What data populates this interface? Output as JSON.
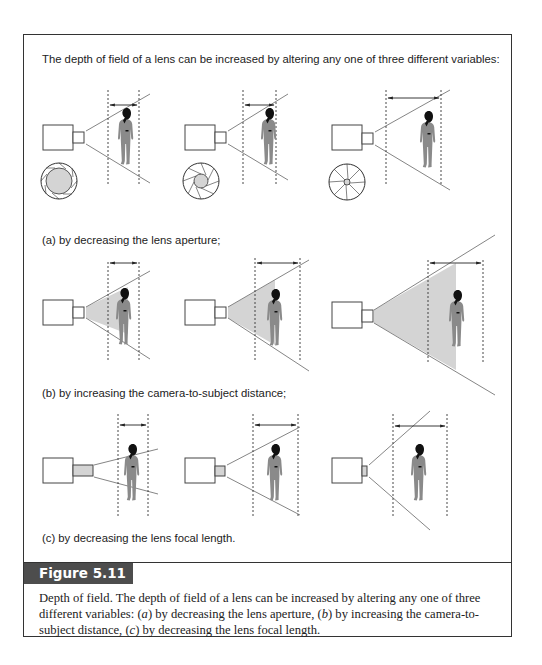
{
  "figure": {
    "intro_text": "The depth of field of a lens can be increased by altering any one of three different variables:",
    "rows": [
      {
        "id": "a",
        "label": "(a) by decreasing the lens aperture;",
        "variable": "lens aperture",
        "panels": [
          "large aperture",
          "medium aperture",
          "small aperture"
        ]
      },
      {
        "id": "b",
        "label": "(b) by increasing the camera-to-subject distance;",
        "variable": "camera-to-subject distance",
        "panels": [
          "near subject",
          "mid distance",
          "far subject"
        ]
      },
      {
        "id": "c",
        "label": "(c) by decreasing the lens focal length.",
        "variable": "lens focal length",
        "panels": [
          "long focal length",
          "medium focal length",
          "short focal length"
        ]
      }
    ],
    "number_label": "Figure 5.11",
    "caption": {
      "part1": "Depth of field. The depth of field of a lens can be increased by altering any one of three different variables: ",
      "a_letter": "a",
      "part2": " by decreasing the lens aperture, ",
      "b_letter": "b",
      "part3": " by increasing the camera-to-subject distance, ",
      "c_letter": "c",
      "part4": " by decreasing the lens focal length."
    }
  },
  "colors": {
    "frame": "#333333",
    "label_bar": "#4d4d4d",
    "shade": "#d4d4d4",
    "figure_gray": "#8a8a8a",
    "figure_head": "#111111"
  }
}
